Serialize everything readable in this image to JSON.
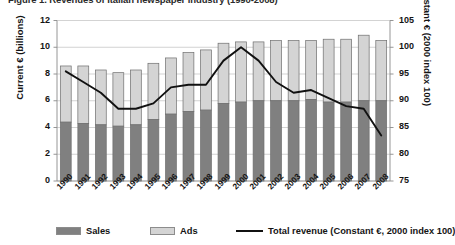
{
  "title": "Figure 1. Revenues of Italian newspaper industry (1990-2008)",
  "axes": {
    "left_title": "Current € (billions)",
    "right_title": "Constant € (2000 index 100)",
    "left_ticks": [
      "0",
      "2",
      "4",
      "6",
      "8",
      "10",
      "12"
    ],
    "right_ticks": [
      "75",
      "80",
      "85",
      "90",
      "95",
      "100",
      "105"
    ]
  },
  "legend": {
    "sales_label": "Sales",
    "ads_label": "Ads",
    "line_label": "Total revenue (Constant €, 2000 index 100)"
  },
  "colors": {
    "sales": "#808080",
    "ads": "#d4d4d4",
    "bar_border": "#6e6e6e",
    "line": "#111111",
    "grid": "#c8c8c8",
    "axis": "#8a8a8a",
    "text": "#141414"
  },
  "chart_data": {
    "type": "bar",
    "subtype": "stacked-bar-with-line-overlay",
    "title": "Figure 1. Revenues of Italian newspaper industry (1990-2008)",
    "xlabel": "",
    "ylabel": "Current € (billions)",
    "y2label": "Constant € (2000 index 100)",
    "ylim": [
      0,
      12
    ],
    "y2lim": [
      75,
      105
    ],
    "ytick_step": 2,
    "y2tick_step": 5,
    "grid": true,
    "legend_position": "bottom",
    "categories": [
      "1990",
      "1991",
      "1992",
      "1993",
      "1994",
      "1995",
      "1996",
      "1997",
      "1998",
      "1999",
      "2000",
      "2001",
      "2002",
      "2003",
      "2004",
      "2005",
      "2006",
      "2007",
      "2008"
    ],
    "series": [
      {
        "name": "Sales",
        "axis": "left",
        "type": "bar-stack",
        "unit": "billion € (current)",
        "values": [
          4.4,
          4.3,
          4.2,
          4.1,
          4.2,
          4.6,
          5.0,
          5.2,
          5.3,
          5.8,
          5.9,
          6.0,
          6.0,
          6.0,
          6.1,
          5.9,
          5.9,
          6.0,
          6.0
        ]
      },
      {
        "name": "Ads",
        "axis": "left",
        "type": "bar-stack",
        "unit": "billion € (current)",
        "values": [
          4.2,
          4.3,
          4.1,
          4.0,
          4.1,
          4.2,
          4.2,
          4.4,
          4.5,
          4.5,
          4.5,
          4.4,
          4.5,
          4.5,
          4.4,
          4.7,
          4.7,
          4.9,
          4.5
        ]
      },
      {
        "name": "Total revenue (Constant €, 2000 index 100)",
        "axis": "right",
        "type": "line",
        "unit": "index (2000 = 100)",
        "values": [
          95.5,
          93.5,
          91.5,
          88.5,
          88.5,
          89.5,
          92.5,
          93.0,
          93.0,
          97.5,
          100.0,
          97.5,
          93.5,
          91.5,
          92.0,
          90.5,
          89.0,
          88.5,
          83.5
        ]
      }
    ],
    "totals": [
      8.6,
      8.6,
      8.3,
      8.1,
      8.3,
      8.8,
      9.2,
      9.6,
      9.8,
      10.3,
      10.4,
      10.4,
      10.5,
      10.5,
      10.5,
      10.6,
      10.6,
      10.9,
      10.5
    ]
  }
}
